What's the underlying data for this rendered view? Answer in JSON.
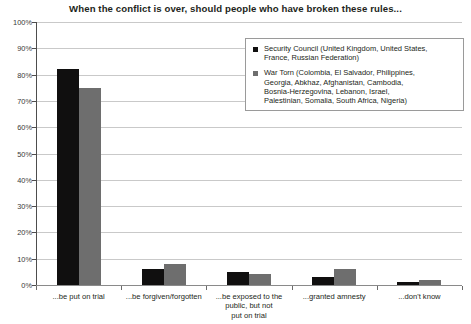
{
  "chart_data": {
    "type": "bar",
    "title": "When the conflict is over, should people who have broken these rules...",
    "xlabel": "",
    "ylabel": "",
    "ylim": [
      0,
      100
    ],
    "ytick_labels": [
      "100%",
      "90%",
      "80%",
      "70%",
      "60%",
      "50%",
      "40%",
      "30%",
      "20%",
      "10%",
      "0%"
    ],
    "ytick_values": [
      100,
      90,
      80,
      70,
      60,
      50,
      40,
      30,
      20,
      10,
      0
    ],
    "grid": true,
    "legend_position": "top-right",
    "categories": [
      "...be put on trial",
      "...be forgiven/forgotten",
      "...be exposed to the public, but not put on trial",
      "...granted amnesty",
      "...don't know"
    ],
    "category_lines": [
      [
        "...be put on trial"
      ],
      [
        "...be forgiven/forgotten"
      ],
      [
        "...be exposed to the",
        "public, but not",
        "put on trial"
      ],
      [
        "...granted amnesty"
      ],
      [
        "...don't know"
      ]
    ],
    "series": [
      {
        "name": "Security Council (United Kingdom, United States, France, Russian Federation)",
        "color": "#100f0f",
        "values": [
          82,
          6,
          5,
          3,
          1
        ]
      },
      {
        "name": "War Torn (Colombia, El Salvador, Philippines, Georgia, Abkhaz, Afghanistan, Cambodia, Bosnia-Herzegovina, Lebanon, Israel, Palestinian, Somalia, South Africa, Nigeria)",
        "color": "#6e6e6e",
        "values": [
          75,
          8,
          4,
          6,
          2
        ]
      }
    ]
  },
  "legend": {
    "entries": [
      {
        "lines": [
          "Security Council (United Kingdom, United States,",
          "France, Russian Federation)"
        ]
      },
      {
        "lines": [
          "War Torn (Colombia, El Salvador, Philippines,",
          "Georgia, Abkhaz, Afghanistan, Cambodia,",
          "Bosnia-Herzegovina, Lebanon, Israel,",
          "Palestinian, Somalia, South Africa, Nigeria)"
        ]
      }
    ]
  },
  "colors": {
    "series_a": "#100f0f",
    "series_b": "#6e6e6e",
    "gridline": "#c9c9c9",
    "axis": "#4d4d4d",
    "text": "#231f20"
  }
}
